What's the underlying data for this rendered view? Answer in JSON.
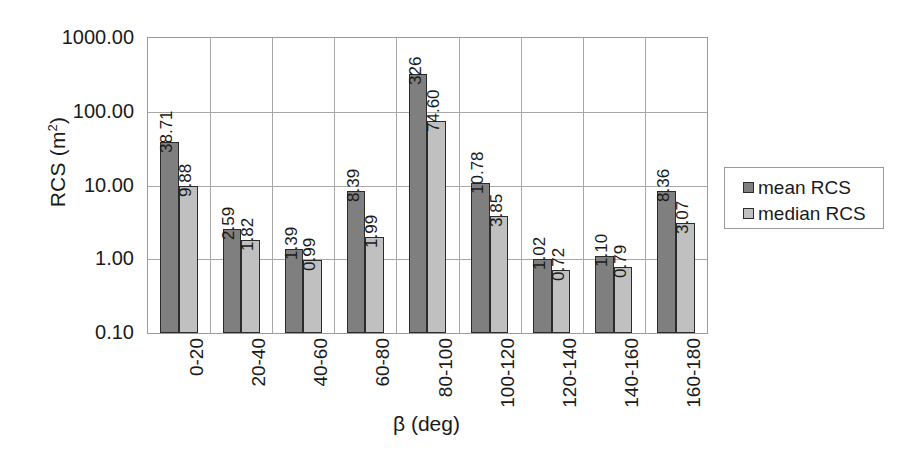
{
  "chart_data": {
    "type": "bar",
    "title": "",
    "subtitle": "",
    "xlabel": "β (deg)",
    "ylabel": "RCS (m2)",
    "ylabel_base": "RCS (m",
    "ylabel_exponent": "2",
    "ylabel_suffix": ")",
    "yscale": "log",
    "ylim": [
      0.1,
      1000
    ],
    "ytick_labels": [
      "1000.00",
      "100.00",
      "10.00",
      "1.00",
      "0.10"
    ],
    "ytick_values": [
      1000,
      100,
      10,
      1,
      0.1
    ],
    "grid": true,
    "grid_orientation": "both",
    "legend_position": "right",
    "categories": [
      "0-20",
      "20-40",
      "40-60",
      "60-80",
      "80-100",
      "100-120",
      "120-140",
      "140-160",
      "160-180"
    ],
    "series": [
      {
        "name": "mean RCS",
        "color": "#7f7f7f",
        "values": [
          38.71,
          2.59,
          1.39,
          8.39,
          326,
          10.78,
          1.02,
          1.1,
          8.36
        ],
        "labels": [
          "38.71",
          "2.59",
          "1.39",
          "8.39",
          "326",
          "10.78",
          "1.02",
          "1.10",
          "8.36"
        ]
      },
      {
        "name": "median RCS",
        "color": "#c0c0c0",
        "values": [
          9.88,
          1.82,
          0.99,
          1.99,
          74.6,
          3.85,
          0.72,
          0.79,
          3.07
        ],
        "labels": [
          "9.88",
          "1.82",
          "0.99",
          "1.99",
          "74.60",
          "3.85",
          "0.72",
          "0.79",
          "3.07"
        ]
      }
    ]
  },
  "legend": {
    "entries": [
      {
        "label": "mean RCS"
      },
      {
        "label": "median RCS"
      }
    ]
  },
  "colors": {
    "series_mean": "#7f7f7f",
    "series_median": "#c0c0c0",
    "axis": "#9a9a9a",
    "grid": "#a8a8a8",
    "bar_outline": "#2b2b2b",
    "text": "#1a1a1a",
    "background": "#ffffff"
  }
}
